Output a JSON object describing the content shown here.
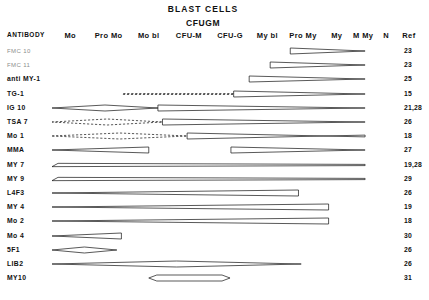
{
  "header": {
    "span_label": "BLAST CELLS",
    "subtitle": "CFUGM",
    "antibody_col": "ANTIBODY",
    "columns": [
      {
        "label": "Mo",
        "x": 77
      },
      {
        "label": "Pro Mo",
        "x": 119
      },
      {
        "label": "Mo bl",
        "x": 163
      },
      {
        "label": "CFU-M",
        "x": 207
      },
      {
        "label": "CFU-G",
        "x": 252
      },
      {
        "label": "My bl",
        "x": 293
      },
      {
        "label": "Pro My",
        "x": 332
      },
      {
        "label": "My",
        "x": 369
      },
      {
        "label": "M My",
        "x": 398
      },
      {
        "label": "N",
        "x": 423
      },
      {
        "label": "Ref",
        "x": 448
      }
    ]
  },
  "chart_data": {
    "type": "table",
    "xlabel": "",
    "ylabel": "ANTIBODY",
    "categories": [
      "Mo",
      "Pro Mo",
      "Mo bl",
      "CFU-M",
      "CFU-G",
      "My bl",
      "Pro My",
      "My",
      "M My",
      "N"
    ],
    "rows": [
      {
        "antibody": "FMC 10",
        "ref": "23",
        "bands": [
          {
            "x1": 318,
            "x2": 400,
            "style": "solid",
            "shape": "wedge-right"
          }
        ]
      },
      {
        "antibody": "FMC 11",
        "ref": "23",
        "bands": [
          {
            "x1": 296,
            "x2": 400,
            "style": "solid",
            "shape": "wedge-right"
          }
        ]
      },
      {
        "antibody": "anti MY-1",
        "ref": "25",
        "bands": [
          {
            "x1": 273,
            "x2": 400,
            "style": "solid",
            "shape": "wedge-right"
          }
        ]
      },
      {
        "antibody": "TG-1",
        "ref": "15",
        "bands": [
          {
            "x1": 135,
            "x2": 256,
            "style": "dashed",
            "shape": "line"
          },
          {
            "x1": 256,
            "x2": 400,
            "style": "solid",
            "shape": "wedge-right"
          }
        ]
      },
      {
        "antibody": "IG 10",
        "ref": "21,28",
        "bands": [
          {
            "x1": 57,
            "x2": 173,
            "style": "solid",
            "shape": "lens"
          },
          {
            "x1": 173,
            "x2": 400,
            "style": "solid",
            "shape": "wedge-right"
          }
        ]
      },
      {
        "antibody": "TSA 7",
        "ref": "26",
        "bands": [
          {
            "x1": 57,
            "x2": 178,
            "style": "dashed",
            "shape": "lens"
          },
          {
            "x1": 178,
            "x2": 400,
            "style": "solid",
            "shape": "wedge-right"
          }
        ]
      },
      {
        "antibody": "Mo 1",
        "ref": "18",
        "bands": [
          {
            "x1": 57,
            "x2": 205,
            "style": "dashed",
            "shape": "lens"
          },
          {
            "x1": 205,
            "x2": 400,
            "style": "solid",
            "shape": "cross"
          }
        ]
      },
      {
        "antibody": "MMA",
        "ref": "27",
        "bands": [
          {
            "x1": 57,
            "x2": 163,
            "style": "solid",
            "shape": "wedge-left"
          },
          {
            "x1": 253,
            "x2": 400,
            "style": "solid",
            "shape": "wedge-right"
          }
        ]
      },
      {
        "antibody": "MY 7",
        "ref": "19,28",
        "bands": [
          {
            "x1": 57,
            "x2": 400,
            "style": "solid",
            "shape": "lens-flat"
          }
        ]
      },
      {
        "antibody": "MY 9",
        "ref": "29",
        "bands": [
          {
            "x1": 57,
            "x2": 400,
            "style": "solid",
            "shape": "lens-flat"
          }
        ]
      },
      {
        "antibody": "L4F3",
        "ref": "26",
        "bands": [
          {
            "x1": 57,
            "x2": 327,
            "style": "solid",
            "shape": "wedge-left"
          }
        ]
      },
      {
        "antibody": "MY 4",
        "ref": "19",
        "bands": [
          {
            "x1": 57,
            "x2": 360,
            "style": "solid",
            "shape": "wedge-left"
          }
        ]
      },
      {
        "antibody": "Mo 2",
        "ref": "18",
        "bands": [
          {
            "x1": 57,
            "x2": 360,
            "style": "solid",
            "shape": "wedge-left"
          }
        ]
      },
      {
        "antibody": "Mo 4",
        "ref": "30",
        "bands": [
          {
            "x1": 57,
            "x2": 133,
            "style": "solid",
            "shape": "wedge-left"
          }
        ]
      },
      {
        "antibody": "5F1",
        "ref": "26",
        "bands": [
          {
            "x1": 57,
            "x2": 128,
            "style": "solid",
            "shape": "lens"
          }
        ]
      },
      {
        "antibody": "LIB2",
        "ref": "26",
        "bands": [
          {
            "x1": 57,
            "x2": 330,
            "style": "solid",
            "shape": "lens"
          }
        ]
      },
      {
        "antibody": "MY10",
        "ref": "31",
        "bands": [
          {
            "x1": 163,
            "x2": 252,
            "style": "solid",
            "shape": "hexagon"
          }
        ]
      }
    ]
  }
}
